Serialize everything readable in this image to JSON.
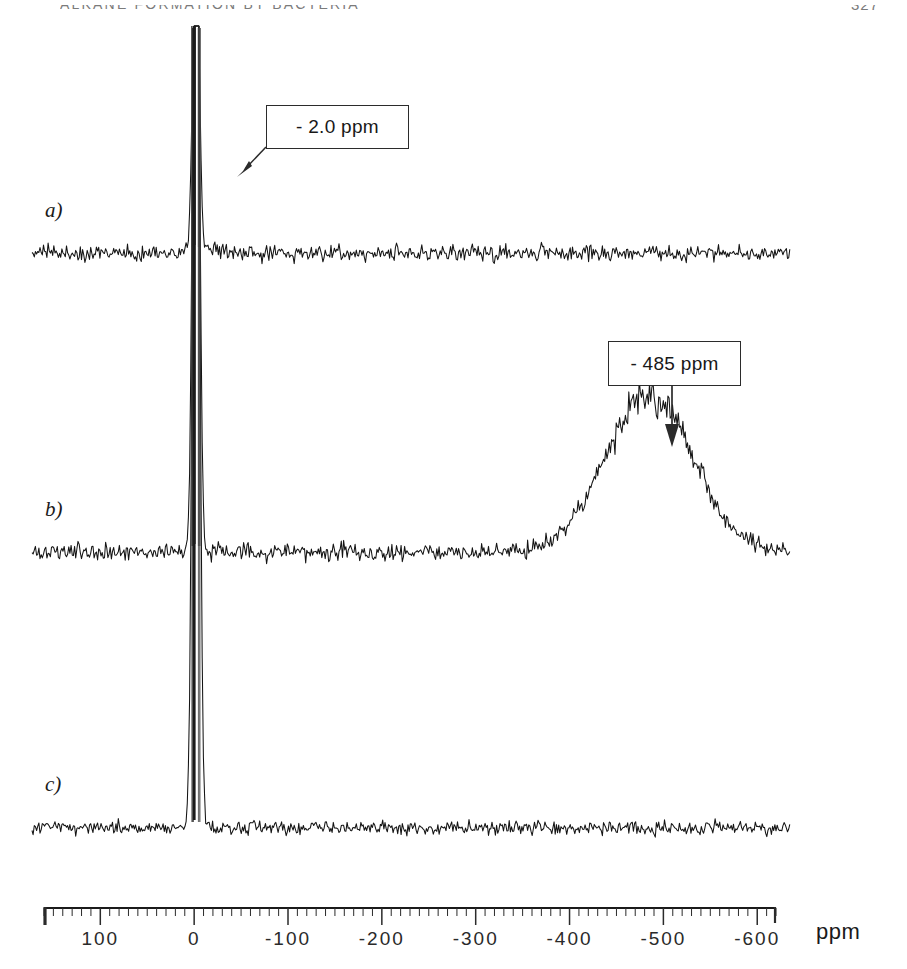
{
  "header": {
    "running_head": "ALKANE FORMATION BY BACTERIA",
    "page_number": "327"
  },
  "figure": {
    "type": "nmr-spectrum-stack",
    "unit_label": "ppm",
    "traces": [
      {
        "id": "a",
        "label": "a)"
      },
      {
        "id": "b",
        "label": "b)"
      },
      {
        "id": "c",
        "label": "c)"
      }
    ],
    "annotations": [
      {
        "id": "peak-2ppm",
        "text": "- 2.0 ppm",
        "arrow": "diagonal-down-left",
        "target_ppm": -2.0,
        "trace": "a"
      },
      {
        "id": "peak-485ppm",
        "text": "- 485 ppm",
        "arrow": "vertical-down",
        "target_ppm": -485,
        "trace": "b"
      }
    ]
  },
  "chart_data": {
    "type": "line",
    "title": "",
    "xlabel": "ppm",
    "ylabel": "",
    "xlim": [
      160,
      -620
    ],
    "x_tick_labels": [
      "100",
      "0",
      "-100",
      "-200",
      "-300",
      "-400",
      "-500",
      "-600"
    ],
    "x_ticks": [
      100,
      0,
      -100,
      -200,
      -300,
      -400,
      -500,
      -600
    ],
    "minor_tick_interval": 10,
    "grid": false,
    "legend": null,
    "axis_direction": "decreasing-left-to-right",
    "series": [
      {
        "name": "a)",
        "baseline_noise_amplitude": 0.05,
        "peaks": [
          {
            "ppm": -2.0,
            "height": 1.0,
            "width": 4,
            "clipped": true
          }
        ]
      },
      {
        "name": "b)",
        "baseline_noise_amplitude": 0.055,
        "peaks": [
          {
            "ppm": -2.0,
            "height": 1.0,
            "width": 4,
            "clipped": true
          },
          {
            "ppm": -485,
            "height": 0.3,
            "width": 62,
            "clipped": false
          }
        ]
      },
      {
        "name": "c)",
        "baseline_noise_amplitude": 0.045,
        "peaks": [
          {
            "ppm": -2.0,
            "height": 1.0,
            "width": 4,
            "clipped": true
          }
        ]
      }
    ]
  }
}
